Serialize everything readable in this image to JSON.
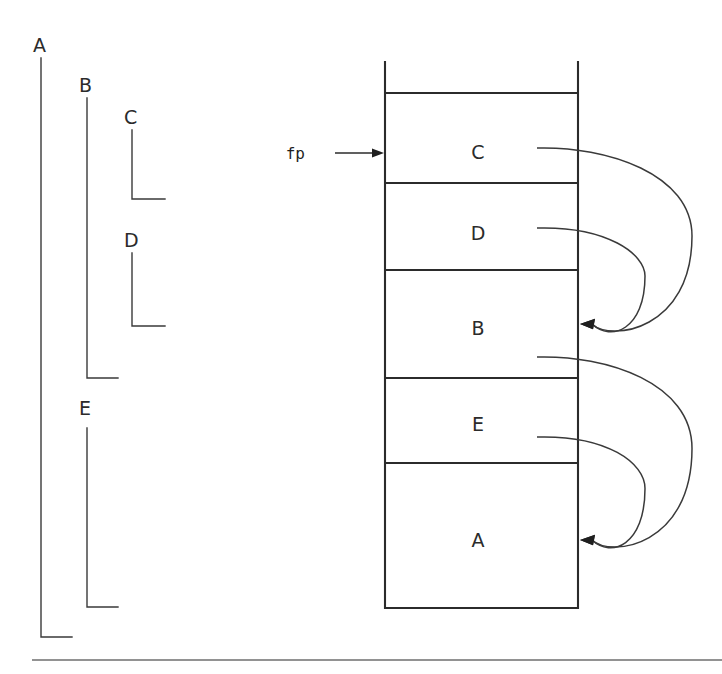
{
  "figure": {
    "background": "#ffffff",
    "ink": "#2b2b2b",
    "width": 722,
    "height": 674
  },
  "lifetimes": {
    "caption": "Nested procedure lifetime brackets",
    "items": [
      {
        "label": "A",
        "label_x": 33,
        "label_y": 52,
        "bracket_x": 41,
        "top_y": 58,
        "bottom_y": 637,
        "foot_x": 72
      },
      {
        "label": "B",
        "label_x": 79,
        "label_y": 92,
        "bracket_x": 87,
        "top_y": 98,
        "bottom_y": 378,
        "foot_x": 118
      },
      {
        "label": "C",
        "label_x": 124,
        "label_y": 124,
        "bracket_x": 132,
        "top_y": 130,
        "bottom_y": 199,
        "foot_x": 165
      },
      {
        "label": "D",
        "label_x": 124,
        "label_y": 247,
        "bracket_x": 132,
        "top_y": 253,
        "bottom_y": 326,
        "foot_x": 165
      },
      {
        "label": "E",
        "label_x": 79,
        "label_y": 415,
        "bracket_x": 87,
        "top_y": 428,
        "bottom_y": 607,
        "foot_x": 118
      }
    ]
  },
  "stack": {
    "caption": "Runtime stack, grows downward",
    "left_x": 385,
    "right_x": 578,
    "top_y": 62,
    "bottom_y": 608,
    "dividers_y": [
      93,
      183,
      270,
      378,
      463
    ],
    "frames": [
      {
        "label": "C",
        "center_x": 478,
        "center_y": 152,
        "top_y": 93,
        "bottom_y": 183
      },
      {
        "label": "D",
        "center_x": 478,
        "center_y": 233,
        "top_y": 183,
        "bottom_y": 270
      },
      {
        "label": "B",
        "center_x": 478,
        "center_y": 328,
        "top_y": 270,
        "bottom_y": 378
      },
      {
        "label": "E",
        "center_x": 478,
        "center_y": 424,
        "top_y": 378,
        "bottom_y": 463
      },
      {
        "label": "A",
        "center_x": 478,
        "center_y": 540,
        "top_y": 463,
        "bottom_y": 608
      }
    ]
  },
  "frame_pointer": {
    "label": "fp",
    "label_x": 305,
    "label_y": 159,
    "line_from_x": 335,
    "line_to_x": 384,
    "line_y": 153
  },
  "links": {
    "caption": "Static links from each frame to its enclosing frame",
    "items": [
      {
        "name": "link-c-to-b",
        "from_frame": "C",
        "to_frame": "B",
        "start_x": 537,
        "start_y": 148,
        "bulge_x": 692,
        "end_x": 580,
        "end_y": 324
      },
      {
        "name": "link-d-to-b",
        "from_frame": "D",
        "to_frame": "B",
        "start_x": 537,
        "start_y": 228,
        "bulge_x": 645,
        "end_x": 580,
        "end_y": 324
      },
      {
        "name": "link-b-to-a",
        "from_frame": "B",
        "to_frame": "A",
        "start_x": 537,
        "start_y": 357,
        "bulge_x": 692,
        "end_x": 580,
        "end_y": 540
      },
      {
        "name": "link-e-to-a",
        "from_frame": "E",
        "to_frame": "A",
        "start_x": 537,
        "start_y": 437,
        "bulge_x": 645,
        "end_x": 580,
        "end_y": 540
      }
    ]
  },
  "footer_rule": {
    "x1": 32,
    "x2": 722,
    "y": 660
  }
}
